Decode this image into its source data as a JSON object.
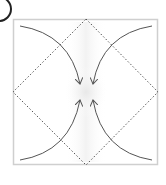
{
  "step": {
    "label": "1"
  },
  "diagram": {
    "square": {
      "x": 13,
      "y": 19,
      "size": 145,
      "stroke": "#cfcfcf",
      "fill": "#ffffff"
    },
    "diamond": {
      "vertices": [
        [
          86,
          19
        ],
        [
          158,
          92
        ],
        [
          86,
          165
        ],
        [
          13,
          92
        ]
      ],
      "stroke": "#555555",
      "style": "dotted"
    },
    "arrows": [
      {
        "name": "top-left-corner-to-center",
        "from": [
          20,
          26
        ],
        "to": [
          80,
          84
        ]
      },
      {
        "name": "top-right-corner-to-center",
        "from": [
          152,
          26
        ],
        "to": [
          93,
          84
        ]
      },
      {
        "name": "bottom-left-corner-to-center",
        "from": [
          20,
          160
        ],
        "to": [
          80,
          100
        ]
      },
      {
        "name": "bottom-right-corner-to-center",
        "from": [
          152,
          160
        ],
        "to": [
          93,
          100
        ]
      }
    ],
    "arrow_color": "#555555",
    "shading_color": "#ececec"
  }
}
